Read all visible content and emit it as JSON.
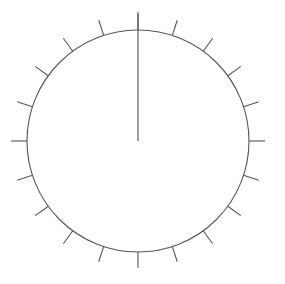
{
  "widget": {
    "name": "analog-dial-gauge",
    "type": "circular-dial",
    "background_color": "#ffffff"
  },
  "chart_data": {
    "type": "scatter",
    "title": "",
    "xlabel": "",
    "ylabel": "",
    "grid": false,
    "legend": null,
    "dial": {
      "center_x": 138,
      "center_y": 141,
      "radius": 111,
      "stroke_color": "#555555",
      "stroke_width": 1.1
    },
    "ticks": {
      "count": 20,
      "angle_step_degrees": 18,
      "start_angle_degrees": 0,
      "length": 16,
      "direction": "outward",
      "stroke_color": "#555555",
      "stroke_width": 1.1,
      "angles_degrees": [
        0,
        18,
        36,
        54,
        72,
        90,
        108,
        126,
        144,
        162,
        180,
        198,
        216,
        234,
        252,
        270,
        288,
        306,
        324,
        342
      ]
    },
    "needle": {
      "angle_degrees": 0,
      "label": "12-o-clock-pointer",
      "tip_radius": 129,
      "tail_radius": 0,
      "stroke_color": "#555555",
      "stroke_width": 1.1,
      "value": 0
    }
  }
}
